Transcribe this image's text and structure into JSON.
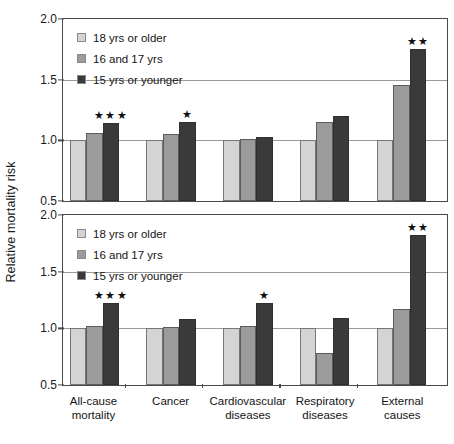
{
  "chart_data": {
    "type": "bar",
    "title": "",
    "xlabel": "",
    "ylabel": "Relative mortality risk",
    "ylim": [
      0.5,
      2.0
    ],
    "yticks": [
      0.5,
      1.0,
      1.5,
      2.0
    ],
    "ytick_labels": [
      "0.5",
      "1.0",
      "1.5",
      "2.0"
    ],
    "grid": true,
    "gridlines_at": [
      1.0,
      1.5
    ],
    "legend_position": "top-left",
    "categories": [
      "All-cause mortality",
      "Cancer",
      "Cardiovascular diseases",
      "Respiratory diseases",
      "External causes"
    ],
    "category_lines": [
      [
        "All-cause",
        "mortality"
      ],
      [
        "Cancer"
      ],
      [
        "Cardiovascular",
        "diseases"
      ],
      [
        "Respiratory",
        "diseases"
      ],
      [
        "External",
        "causes"
      ]
    ],
    "series_names": [
      "18 yrs or older",
      "16 and 17 yrs",
      "15 yrs or younger"
    ],
    "series_colors": [
      "#d4d4d4",
      "#9b9b9b",
      "#3a3a3a"
    ],
    "panels": [
      {
        "name": "top-panel",
        "series": [
          {
            "name": "18 yrs or older",
            "values": [
              1.0,
              1.0,
              1.0,
              1.0,
              1.0
            ]
          },
          {
            "name": "16 and 17 yrs",
            "values": [
              1.06,
              1.05,
              1.01,
              1.15,
              1.46
            ]
          },
          {
            "name": "15 yrs or younger",
            "values": [
              1.14,
              1.15,
              1.03,
              1.2,
              1.75
            ]
          }
        ],
        "significance": [
          {
            "category_index": 0,
            "series_index": 2,
            "marker": "★★★"
          },
          {
            "category_index": 1,
            "series_index": 2,
            "marker": "★"
          },
          {
            "category_index": 4,
            "series_index": 2,
            "marker": "★★"
          }
        ]
      },
      {
        "name": "bottom-panel",
        "series": [
          {
            "name": "18 yrs or older",
            "values": [
              1.0,
              1.0,
              1.0,
              1.0,
              1.0
            ]
          },
          {
            "name": "16 and 17 yrs",
            "values": [
              1.02,
              1.01,
              1.02,
              0.78,
              1.17
            ]
          },
          {
            "name": "15 yrs or younger",
            "values": [
              1.22,
              1.08,
              1.22,
              1.09,
              1.82
            ]
          }
        ],
        "significance": [
          {
            "category_index": 0,
            "series_index": 2,
            "marker": "★★★"
          },
          {
            "category_index": 2,
            "series_index": 2,
            "marker": "★"
          },
          {
            "category_index": 4,
            "series_index": 2,
            "marker": "★★"
          }
        ]
      }
    ]
  },
  "legend": {
    "items": [
      {
        "label": "18 yrs or older",
        "color": "#d4d4d4"
      },
      {
        "label": "16 and 17 yrs",
        "color": "#9b9b9b"
      },
      {
        "label": "15 yrs or younger",
        "color": "#3a3a3a"
      }
    ]
  },
  "axis": {
    "y_title": "Relative mortality risk"
  }
}
